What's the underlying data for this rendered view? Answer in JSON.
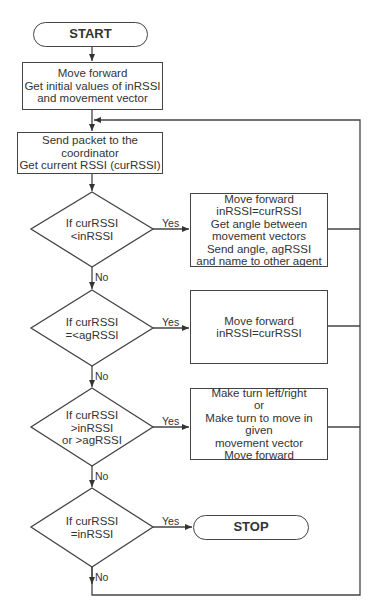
{
  "flowchart": {
    "start": "START",
    "stop": "STOP",
    "init_box": "Move forward\nGet initial values of inRSSI\nand movement vector",
    "send_box": "Send packet to the coordinator\nGet current RSSI (curRSSI)",
    "decisions": [
      {
        "text": "If curRSSI\n<inRSSI",
        "yes": "Yes",
        "no": "No"
      },
      {
        "text": "If curRSSI\n=<agRSSI",
        "yes": "Yes",
        "no": "No"
      },
      {
        "text": "If curRSSI\n>inRSSI\nor >agRSSI",
        "yes": "Yes",
        "no": "No"
      },
      {
        "text": "If curRSSI\n=inRSSI",
        "yes": "Yes",
        "no": "No"
      }
    ],
    "actions": [
      "Move forward\ninRSSI=curRSSI\nGet angle between\nmovement vectors\nSend angle, agRSSI\nand name to other agent",
      "Move forward\ninRSSI=curRSSI",
      "Make turn left/right\nor\nMake turn to move in given\nmovement vector\nMove forward"
    ]
  }
}
